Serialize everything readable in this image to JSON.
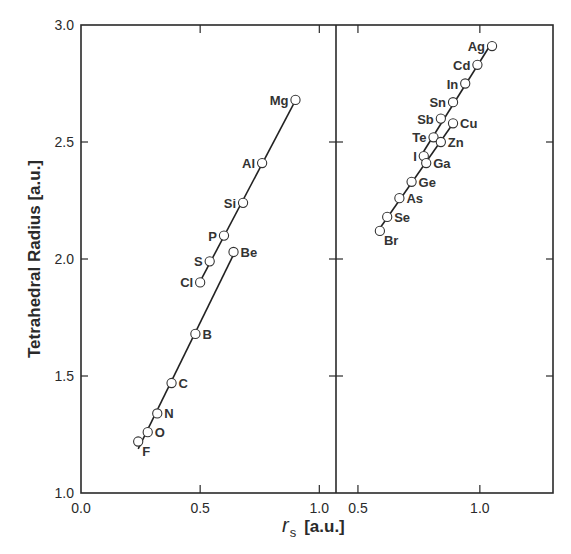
{
  "chart_data": {
    "type": "scatter",
    "title": "",
    "ylabel": "Tetrahedral Radius [a.u.]",
    "xlabel_symbol": "r",
    "xlabel_subscript": "s",
    "xlabel_units": "[a.u.]",
    "ylim": [
      1.0,
      3.0
    ],
    "yticks": [
      "1.0",
      "1.5",
      "2.0",
      "2.5",
      "3.0"
    ],
    "grid": false,
    "legend": null,
    "panels": [
      {
        "name": "left",
        "xlim": [
          0.0,
          1.07
        ],
        "xticks": [
          "0.0",
          "0.5",
          "1.0"
        ],
        "series": [
          {
            "name": "Mg-Al-Si-P-S-Cl series",
            "points": [
              {
                "label": "Mg",
                "x": 0.9,
                "y": 2.68,
                "label_side": "left"
              },
              {
                "label": "Al",
                "x": 0.76,
                "y": 2.41,
                "label_side": "left"
              },
              {
                "label": "Si",
                "x": 0.68,
                "y": 2.24,
                "label_side": "left"
              },
              {
                "label": "P",
                "x": 0.6,
                "y": 2.1,
                "label_side": "left"
              },
              {
                "label": "S",
                "x": 0.54,
                "y": 1.99,
                "label_side": "left"
              },
              {
                "label": "Cl",
                "x": 0.5,
                "y": 1.9,
                "label_side": "left"
              }
            ]
          },
          {
            "name": "Be-B-C-N-O-F series",
            "points": [
              {
                "label": "Be",
                "x": 0.64,
                "y": 2.03,
                "label_side": "right"
              },
              {
                "label": "B",
                "x": 0.48,
                "y": 1.68,
                "label_side": "right"
              },
              {
                "label": "C",
                "x": 0.38,
                "y": 1.47,
                "label_side": "right"
              },
              {
                "label": "N",
                "x": 0.32,
                "y": 1.34,
                "label_side": "right"
              },
              {
                "label": "O",
                "x": 0.28,
                "y": 1.26,
                "label_side": "right"
              },
              {
                "label": "F",
                "x": 0.24,
                "y": 1.22,
                "label_side": "right-below"
              }
            ]
          }
        ]
      },
      {
        "name": "right",
        "xlim": [
          0.41,
          1.3
        ],
        "xticks": [
          "0.5",
          "1.0"
        ],
        "series": [
          {
            "name": "Ag-Cd-In-Sn-Sb-Te-I series",
            "points": [
              {
                "label": "Ag",
                "x": 1.05,
                "y": 2.91,
                "label_side": "left"
              },
              {
                "label": "Cd",
                "x": 0.99,
                "y": 2.83,
                "label_side": "left"
              },
              {
                "label": "In",
                "x": 0.94,
                "y": 2.75,
                "label_side": "left"
              },
              {
                "label": "Sn",
                "x": 0.89,
                "y": 2.67,
                "label_side": "left"
              },
              {
                "label": "Sb",
                "x": 0.84,
                "y": 2.6,
                "label_side": "left"
              },
              {
                "label": "Te",
                "x": 0.81,
                "y": 2.52,
                "label_side": "left"
              },
              {
                "label": "I",
                "x": 0.77,
                "y": 2.44,
                "label_side": "left"
              }
            ]
          },
          {
            "name": "Cu-Zn-Ga-Ge-As-Se-Br series",
            "points": [
              {
                "label": "Cu",
                "x": 0.89,
                "y": 2.58,
                "label_side": "right"
              },
              {
                "label": "Zn",
                "x": 0.84,
                "y": 2.5,
                "label_side": "right"
              },
              {
                "label": "Ga",
                "x": 0.78,
                "y": 2.41,
                "label_side": "right"
              },
              {
                "label": "Ge",
                "x": 0.72,
                "y": 2.33,
                "label_side": "right"
              },
              {
                "label": "As",
                "x": 0.67,
                "y": 2.26,
                "label_side": "right"
              },
              {
                "label": "Se",
                "x": 0.62,
                "y": 2.18,
                "label_side": "right"
              },
              {
                "label": "Br",
                "x": 0.59,
                "y": 2.12,
                "label_side": "right-below"
              }
            ]
          }
        ]
      }
    ]
  }
}
